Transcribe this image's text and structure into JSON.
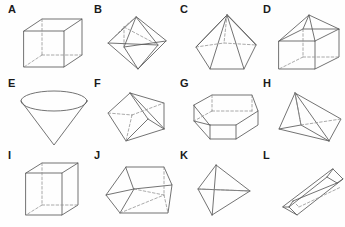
{
  "sheet": {
    "title": "Geometric solids identification sheet",
    "background_color": "#fefefe",
    "edge_color": "#5a5a5a",
    "hidden_edge_color": "#8d8d8d",
    "label_color": "#1b1b1b",
    "rows": 3,
    "columns": 4,
    "total_figures": 12
  },
  "figures": [
    {
      "label": "A",
      "name": "cube",
      "row": 1,
      "col": 1,
      "hidden_edges": true
    },
    {
      "label": "B",
      "name": "octahedron",
      "row": 1,
      "col": 2,
      "hidden_edges": true
    },
    {
      "label": "C",
      "name": "pentagonal-pyramid",
      "row": 1,
      "col": 3,
      "hidden_edges": true
    },
    {
      "label": "D",
      "name": "cube-with-pyramid-roof",
      "row": 1,
      "col": 4,
      "hidden_edges": true
    },
    {
      "label": "E",
      "name": "inverted-cone",
      "row": 2,
      "col": 1,
      "hidden_edges": false
    },
    {
      "label": "F",
      "name": "tilted-square-pyramid",
      "row": 2,
      "col": 2,
      "hidden_edges": true
    },
    {
      "label": "G",
      "name": "hexagonal-prism",
      "row": 2,
      "col": 3,
      "hidden_edges": true
    },
    {
      "label": "H",
      "name": "triangular-prism-wedge",
      "row": 2,
      "col": 4,
      "hidden_edges": true
    },
    {
      "label": "I",
      "name": "tall-cube",
      "row": 3,
      "col": 1,
      "hidden_edges": true
    },
    {
      "label": "J",
      "name": "truncated-pyramid-frustum",
      "row": 3,
      "col": 2,
      "hidden_edges": true
    },
    {
      "label": "K",
      "name": "tetrahedron",
      "row": 3,
      "col": 3,
      "hidden_edges": true
    },
    {
      "label": "L",
      "name": "elongated-open-trough",
      "row": 3,
      "col": 4,
      "hidden_edges": true
    }
  ]
}
